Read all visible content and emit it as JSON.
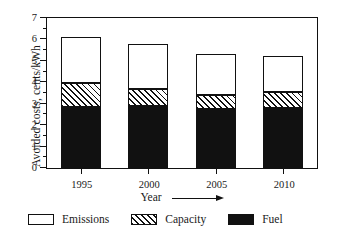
{
  "chart_data": {
    "type": "bar",
    "stacked": true,
    "title": "",
    "xlabel": "Year",
    "xlabel_arrow": "→",
    "ylabel": "Avoided costs, cents/kWh",
    "categories": [
      "1995",
      "2000",
      "2005",
      "2010"
    ],
    "ylim": [
      0,
      7
    ],
    "yticks": [
      0,
      1,
      2,
      3,
      4,
      5,
      6,
      7
    ],
    "ytick_labels": [
      "0",
      "1",
      "2",
      "3",
      "4",
      "5",
      "6",
      "7"
    ],
    "yminor_step": 0.5,
    "grid": false,
    "legend_position": "below",
    "series": [
      {
        "name": "Fuel",
        "fill": "solid-black",
        "color": "#111111",
        "values": [
          2.83,
          2.9,
          2.75,
          2.82
        ]
      },
      {
        "name": "Capacity",
        "fill": "diagonal-hatch",
        "color": "#ffffff",
        "values": [
          1.12,
          0.78,
          0.67,
          0.71
        ]
      },
      {
        "name": "Emissions",
        "fill": "white",
        "color": "#ffffff",
        "values": [
          2.17,
          2.09,
          1.9,
          1.72
        ]
      }
    ],
    "cumulative_tops": {
      "fuel": [
        2.83,
        2.9,
        2.75,
        2.82
      ],
      "capacity": [
        3.95,
        3.68,
        3.42,
        3.53
      ],
      "total": [
        6.12,
        5.77,
        5.32,
        5.25
      ]
    }
  },
  "legend": {
    "items": [
      {
        "label": "Emissions",
        "swatch": "white-box-swatch"
      },
      {
        "label": "Capacity",
        "swatch": "hatched-box-swatch"
      },
      {
        "label": "Fuel",
        "swatch": "black-box-swatch"
      }
    ]
  }
}
